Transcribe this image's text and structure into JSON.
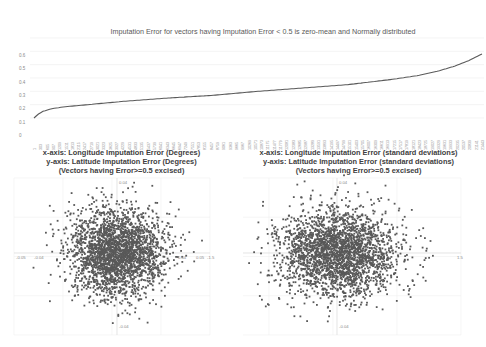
{
  "chart_data": [
    {
      "type": "line",
      "title": "Imputation Error for vectors having Imputation Error < 0.5 is zero-mean and Normally distributed",
      "xlabel": "",
      "ylabel": "",
      "ylim": [
        0,
        0.6
      ],
      "yticks": [
        "0",
        "0.1",
        "0.2",
        "0.3",
        "0.4",
        "0.5",
        "0.6"
      ],
      "xticks": [
        "1",
        "303",
        "605",
        "907",
        "1209",
        "1511",
        "1813",
        "2115",
        "2417",
        "2719",
        "3021",
        "3323",
        "3625",
        "3927",
        "4229",
        "4531",
        "4833",
        "5135",
        "5437",
        "5739",
        "6041",
        "6343",
        "6645",
        "6947",
        "7249",
        "7551",
        "7853",
        "8155",
        "8457",
        "8759",
        "9061",
        "9363",
        "9665",
        "9967",
        "10269",
        "10571",
        "10873",
        "11175",
        "11477",
        "11779",
        "12081",
        "12383",
        "12685",
        "12987",
        "13289",
        "13591",
        "13893",
        "14195",
        "14497",
        "14799",
        "15101",
        "15403",
        "15705",
        "16007",
        "16309",
        "16611",
        "16913",
        "17215",
        "17517",
        "17819",
        "18121",
        "18423",
        "18725",
        "19027",
        "19329",
        "19631",
        "19933",
        "20235",
        "20537",
        "20839",
        "21141",
        "21443"
      ],
      "grid": true,
      "legend": "none",
      "series": [
        {
          "name": "Imputation Error (sorted)",
          "color": "#595959",
          "x_frac": [
            0,
            0.01,
            0.02,
            0.04,
            0.07,
            0.12,
            0.2,
            0.3,
            0.4,
            0.5,
            0.6,
            0.7,
            0.8,
            0.86,
            0.9,
            0.94,
            0.97,
            1.0
          ],
          "values": [
            0.0,
            0.03,
            0.05,
            0.07,
            0.085,
            0.1,
            0.125,
            0.15,
            0.17,
            0.2,
            0.225,
            0.25,
            0.29,
            0.32,
            0.35,
            0.39,
            0.43,
            0.48
          ]
        }
      ]
    },
    {
      "type": "scatter",
      "title_lines": [
        "x-axis: Longitude Imputation Error (Degrees)",
        "y-axis: Latitude Imputation Error (Degrees)",
        "(Vectors having Error>=0.5 excised)"
      ],
      "xlim": [
        -0.05,
        0.05
      ],
      "ylim": [
        -0.04,
        0.04
      ],
      "xticks": [
        "-0.05",
        "-0.04",
        "-0.03",
        "-0.02",
        "-0.01",
        "0",
        "0.01",
        "0.02",
        "0.03",
        "0.04",
        "0.05"
      ],
      "yticks": [
        "0.04",
        "0.03",
        "0.02",
        "0.01",
        "0",
        "-0.01",
        "-0.02",
        "-0.03",
        "-0.04"
      ],
      "color": "#595959",
      "description": "Dense roughly circular cloud of points centered at origin, bivariate normal"
    },
    {
      "type": "scatter",
      "title_lines": [
        "x-axis: Longitude Imputation Error (standard deviations)",
        "y-axis: Latitude Imputation Error (standard deviations)",
        "(Vectors having Error>=0.5 excised)"
      ],
      "xlim": [
        -1.5,
        1.5
      ],
      "ylim": [
        -0.04,
        0.04
      ],
      "xticks": [
        "-1.5",
        "-1",
        "-0.5",
        "0",
        "0.5",
        "1",
        "1.5"
      ],
      "yticks": [
        "0.04",
        "0.03",
        "0.02",
        "0.01",
        "0",
        "-0.01",
        "-0.02",
        "-0.03",
        "-0.04"
      ],
      "color": "#595959",
      "description": "Dense roughly elliptical cloud of points centered at origin, bivariate normal"
    }
  ]
}
